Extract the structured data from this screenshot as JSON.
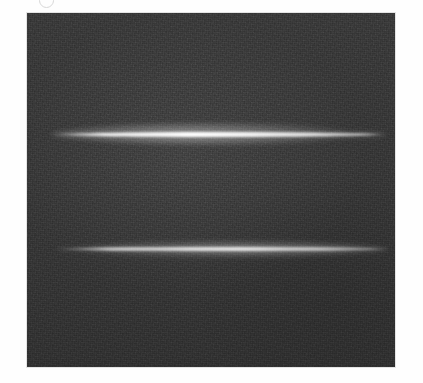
{
  "figure": {
    "marker_label": "",
    "marker_name": "figure-panel-label",
    "canvas_width": 423,
    "canvas_height": 383,
    "page_background": "#fefefe"
  },
  "panel": {
    "name": "detector-image-panel",
    "x": 27,
    "y": 13,
    "width": 368,
    "height": 354,
    "background_color": "#3a3a3a",
    "border_color": "#e4e4e4",
    "noise_description": "fine monochrome sensor grain"
  },
  "chart_data": {
    "type": "heatmap",
    "title": "",
    "subtitle": "",
    "xlabel": "",
    "ylabel": "",
    "colormap": "grayscale",
    "grid": false,
    "legend": "none",
    "xlim": [
      0,
      368
    ],
    "ylim": [
      0,
      354
    ],
    "background_level": 0.22,
    "peak_level": 1.0,
    "features": [
      {
        "name": "bright-streak-upper",
        "kind": "horizontal-line-emission",
        "center_y": 121,
        "x_start": 23,
        "x_end": 361,
        "core_thickness": 5,
        "halo_thickness": 22,
        "peak_color": "#ededed",
        "halo_color": "#9a9a9a",
        "relative_intensity": 1.0,
        "brightest_x_fraction": 0.42
      },
      {
        "name": "bright-streak-lower",
        "kind": "horizontal-line-emission",
        "center_y": 236,
        "x_start": 28,
        "x_end": 363,
        "core_thickness": 4,
        "halo_thickness": 16,
        "peak_color": "#dcdcdc",
        "halo_color": "#8a8a8a",
        "relative_intensity": 0.82,
        "brightest_x_fraction": 0.55
      }
    ]
  }
}
